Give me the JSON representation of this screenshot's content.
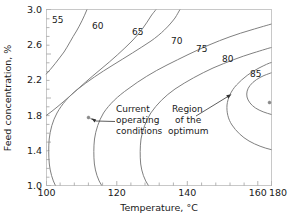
{
  "chart_data": {
    "type": "line",
    "subtype": "contour",
    "title": "",
    "xlabel": "Temperature, °C",
    "ylabel": "Feed concentration, %",
    "xlim": [
      100,
      180
    ],
    "ylim": [
      1.0,
      3.0
    ],
    "xticks": [
      100,
      120,
      140,
      160,
      180
    ],
    "yticks": [
      1.0,
      1.4,
      1.8,
      2.2,
      2.6,
      3.0
    ],
    "xtick_labels": [
      "100",
      "120",
      "140",
      "160",
      "180"
    ],
    "ytick_labels": [
      "1.0",
      "1.4",
      "1.8",
      "2.2",
      "2.6",
      "3.0"
    ],
    "grid": false,
    "legend": "none",
    "contour_levels": [
      55,
      60,
      65,
      70,
      75,
      80,
      85
    ],
    "contour_level_labels": [
      "55",
      "60",
      "65",
      "70",
      "75",
      "80",
      "85"
    ],
    "contour_color": "#808080",
    "series": [
      {
        "name": "55",
        "label": "55",
        "label_xy": [
          106.5,
          2.89
        ],
        "points": [
          [
            100,
            2.74
          ],
          [
            104,
            2.85
          ],
          [
            109,
            2.95
          ],
          [
            113,
            3.0
          ]
        ]
      },
      {
        "name": "60",
        "label": "60",
        "label_xy": [
          117.5,
          2.86
        ],
        "points": [
          [
            100,
            2.36
          ],
          [
            108,
            2.55
          ],
          [
            116,
            2.72
          ],
          [
            124,
            2.86
          ],
          [
            132,
            2.97
          ],
          [
            137,
            3.0
          ]
        ]
      },
      {
        "name": "65",
        "label": "65",
        "label_xy": [
          131.5,
          2.78
        ],
        "points": [
          [
            110.5,
            1.0
          ],
          [
            107.5,
            1.3
          ],
          [
            106.2,
            1.62
          ],
          [
            106.5,
            1.95
          ],
          [
            108.5,
            2.23
          ],
          [
            113,
            2.46
          ],
          [
            119,
            2.63
          ],
          [
            127,
            2.78
          ],
          [
            136,
            2.89
          ],
          [
            146,
            2.97
          ],
          [
            153,
            3.0
          ]
        ]
      },
      {
        "name": "70",
        "label": "70",
        "label_xy": [
          158.0,
          2.66
        ],
        "points": [
          [
            124.5,
            1.0
          ],
          [
            121,
            1.3
          ],
          [
            119.5,
            1.62
          ],
          [
            120,
            1.95
          ],
          [
            122.5,
            2.2
          ],
          [
            127.5,
            2.42
          ],
          [
            135,
            2.58
          ],
          [
            145,
            2.71
          ],
          [
            156,
            2.8
          ],
          [
            168,
            2.87
          ],
          [
            180,
            2.92
          ]
        ]
      },
      {
        "name": "75",
        "label": "75",
        "label_xy": [
          167.5,
          2.55
        ],
        "points": [
          [
            148,
            1.0
          ],
          [
            143.5,
            1.28
          ],
          [
            141.5,
            1.6
          ],
          [
            142,
            1.92
          ],
          [
            145,
            2.16
          ],
          [
            150.5,
            2.35
          ],
          [
            158,
            2.49
          ],
          [
            167,
            2.59
          ],
          [
            180,
            2.68
          ]
        ]
      },
      {
        "name": "80",
        "label": "80",
        "label_xy": [
          179.5,
          2.42
        ],
        "points": [
          [
            180,
            1.28
          ],
          [
            172,
            1.32
          ],
          [
            165,
            1.45
          ],
          [
            160.5,
            1.65
          ],
          [
            158.5,
            1.9
          ],
          [
            159.5,
            2.1
          ],
          [
            163,
            2.27
          ],
          [
            169,
            2.4
          ],
          [
            176,
            2.48
          ],
          [
            180,
            2.51
          ]
        ]
      },
      {
        "name": "85",
        "label": "85",
        "label_xy": [
          208.5,
          2.24
        ],
        "points": [
          [
            180,
            1.68
          ],
          [
            173,
            1.74
          ],
          [
            167.5,
            1.88
          ],
          [
            165.5,
            2.03
          ],
          [
            167,
            2.17
          ],
          [
            171.5,
            2.27
          ],
          [
            178,
            2.33
          ],
          [
            180,
            2.34
          ]
        ]
      }
    ],
    "markers": [
      {
        "name": "current-operating-conditions",
        "x": 115.0,
        "y": 1.81,
        "label": "Current\noperating\nconditions",
        "label_lines": [
          "Current",
          "operating",
          "conditions"
        ],
        "label_xy": [
          131.5,
          1.75
        ]
      },
      {
        "name": "region-of-the-optimum",
        "x": 179.0,
        "y": 2.05,
        "label": "Region\nof the\noptimum",
        "label_lines": [
          "Region",
          "of the",
          "optimum"
        ],
        "label_xy": [
          159.0,
          1.78
        ]
      }
    ],
    "annotations": [
      {
        "name": "current-operating-conditions-annotation",
        "lines": [
          "Current",
          "operating",
          "conditions"
        ],
        "arrow_from": [
          129.5,
          1.72
        ],
        "arrow_to": [
          116.0,
          1.79
        ]
      },
      {
        "name": "region-of-the-optimum-annotation",
        "lines": [
          "Region",
          "of the",
          "optimum"
        ],
        "arrow_from": [
          156.0,
          1.68
        ],
        "arrow_to": [
          170.5,
          2.03
        ]
      }
    ]
  },
  "axes": {
    "x_title": "Temperature, °C",
    "y_title": "Feed concentration, %",
    "x_tick_labels": [
      "100",
      "120",
      "140",
      "160",
      "180"
    ],
    "y_tick_labels": [
      "1.0",
      "1.4",
      "1.8",
      "2.2",
      "2.6",
      "3.0"
    ]
  },
  "contour_labels": [
    "55",
    "60",
    "65",
    "70",
    "75",
    "80",
    "85"
  ],
  "annotations": {
    "current": {
      "line1": "Current",
      "line2": "operating",
      "line3": "conditions"
    },
    "optimum": {
      "line1": "Region",
      "line2": "of the",
      "line3": "optimum"
    }
  },
  "colors": {
    "contour": "#808080",
    "frame": "#c8c8c8",
    "text": "#1a1a1a",
    "marker": "#8a8a8a",
    "background": "#ffffff"
  }
}
